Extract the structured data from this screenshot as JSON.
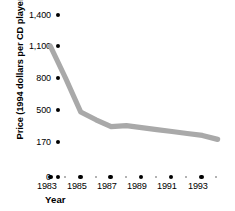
{
  "chart_data": {
    "type": "line",
    "title": "",
    "xlabel": "Year",
    "ylabel": "Price (1994 dollars per CD player)",
    "x": [
      1983,
      1984,
      1985,
      1986,
      1987,
      1988,
      1989,
      1990,
      1991,
      1992,
      1993,
      1994
    ],
    "values": [
      1100,
      800,
      480,
      400,
      330,
      340,
      320,
      300,
      280,
      260,
      240,
      200
    ],
    "series": [
      {
        "name": "Price per CD player",
        "values": [
          1100,
          800,
          480,
          400,
          330,
          340,
          320,
          300,
          280,
          260,
          240,
          200
        ]
      }
    ],
    "y_ticks": [
      0,
      170,
      500,
      800,
      1100,
      1400
    ],
    "y_tick_labels": [
      "0",
      "170",
      "500",
      "800",
      "1,100",
      "1,400"
    ],
    "x_tick_labels": [
      "1983",
      "1985",
      "1987",
      "1989",
      "1991",
      "1993"
    ],
    "x_major_years": [
      1983,
      1985,
      1987,
      1989,
      1991,
      1993
    ],
    "x_minor_years": [
      1984,
      1986,
      1988,
      1990,
      1992,
      1994
    ],
    "xlim": [
      1983,
      1994
    ],
    "ylim": [
      0,
      1400
    ],
    "grid": false,
    "legend": "none",
    "line_color": "#a9a9a9",
    "marker_color": "#000000"
  },
  "axes": {
    "y_title": "Price (1994 dollars per CD player)",
    "x_title": "Year"
  }
}
